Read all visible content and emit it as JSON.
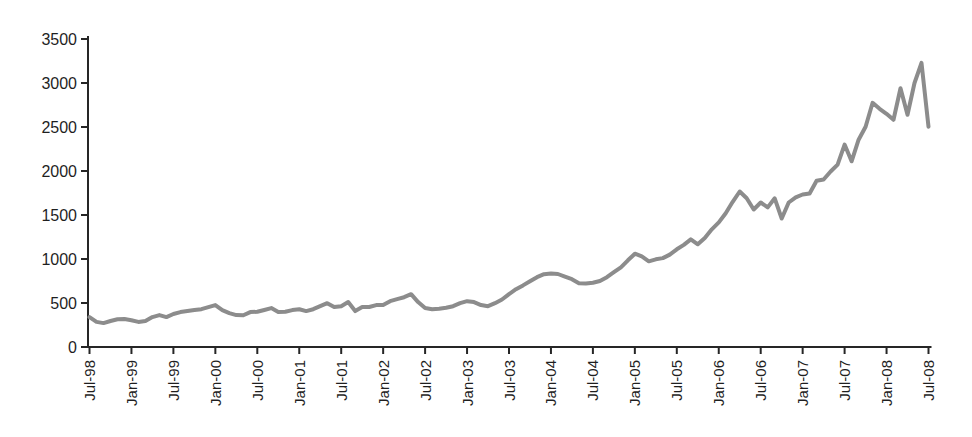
{
  "figure": {
    "background": "#ffffff",
    "axis_color": "#262626",
    "label_color": "#1f1f1f"
  },
  "chart_data": {
    "type": "line",
    "title": "",
    "xlabel": "",
    "ylabel": "",
    "grid": false,
    "legend": "none",
    "ylim": [
      0,
      3500
    ],
    "y_ticks": [
      0,
      500,
      1000,
      1500,
      2000,
      2500,
      3000,
      3500
    ],
    "x_start": "Jul-98",
    "x_end": "Jul-08",
    "x_interval_months": 1,
    "x_tick_every_months": 6,
    "x_tick_labels": [
      "Jul-98",
      "Jan-99",
      "Jul-99",
      "Jan-00",
      "Jul-00",
      "Jan-01",
      "Jul-01",
      "Jan-02",
      "Jul-02",
      "Jan-03",
      "Jul-03",
      "Jan-04",
      "Jul-04",
      "Jan-05",
      "Jul-05",
      "Jan-06",
      "Jul-06",
      "Jan-07",
      "Jul-07",
      "Jan-08",
      "Jul-08"
    ],
    "series": [
      {
        "name": "monthly-value",
        "color": "#8c8c8c",
        "stroke_width": 4,
        "values": [
          340,
          285,
          272,
          295,
          315,
          317,
          305,
          285,
          295,
          340,
          363,
          340,
          375,
          397,
          408,
          419,
          430,
          453,
          476,
          419,
          385,
          363,
          360,
          397,
          400,
          420,
          442,
          397,
          400,
          419,
          430,
          408,
          430,
          464,
          498,
          453,
          464,
          510,
          408,
          453,
          455,
          476,
          476,
          521,
          544,
          566,
          600,
          510,
          442,
          430,
          435,
          445,
          464,
          498,
          521,
          510,
          476,
          464,
          498,
          540,
          600,
          657,
          700,
          748,
          793,
          827,
          835,
          830,
          800,
          770,
          725,
          720,
          730,
          750,
          793,
          850,
          906,
          985,
          1060,
          1030,
          974,
          997,
          1010,
          1050,
          1110,
          1160,
          1223,
          1167,
          1240,
          1337,
          1416,
          1520,
          1650,
          1767,
          1690,
          1563,
          1642,
          1586,
          1690,
          1460,
          1642,
          1700,
          1733,
          1744,
          1890,
          1903,
          1994,
          2073,
          2300,
          2110,
          2356,
          2503,
          2775,
          2707,
          2650,
          2582,
          2940,
          2640,
          3000,
          3228,
          2503
        ]
      }
    ]
  }
}
